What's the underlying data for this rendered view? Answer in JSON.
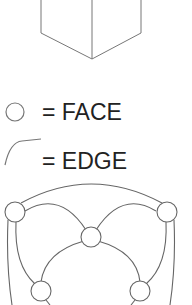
{
  "diagram": {
    "legend": {
      "face": {
        "symbol": "circle-icon",
        "label": "= FACE"
      },
      "edge": {
        "symbol": "curve-icon",
        "label": "= EDGE"
      }
    },
    "colors": {
      "stroke": "#6e6e6e",
      "text": "#222222",
      "background": "#ffffff"
    }
  }
}
